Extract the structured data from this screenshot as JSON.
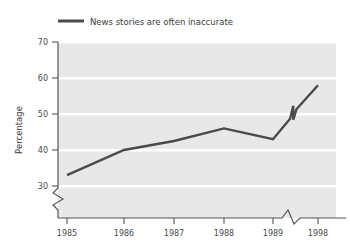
{
  "chart_data": {
    "type": "line",
    "title": "",
    "subtitle": "",
    "xlabel": "",
    "ylabel": "Percentage",
    "legend_position": "top-left",
    "grid": "horizontal-white-gridlines",
    "background_color": "#e8e8e8",
    "line_color": "#4a4a4a",
    "axis_color": "#555555",
    "x": [
      "1985",
      "1986",
      "1987",
      "1988",
      "1989",
      "1998"
    ],
    "categories": [
      "1985",
      "1986",
      "1987",
      "1988",
      "1989",
      "1998"
    ],
    "xticklabels": [
      "1985",
      "1986",
      "1987",
      "1988",
      "1989",
      "1998"
    ],
    "yticklabels": [
      "30",
      "40",
      "50",
      "60",
      "70"
    ],
    "ytickvalues": [
      30,
      40,
      50,
      60,
      70
    ],
    "ylim": [
      26,
      70
    ],
    "xaxis_break": true,
    "xaxis_break_between": [
      "1989",
      "1998"
    ],
    "yaxis_break": true,
    "yaxis_break_below": 30,
    "line_break_marker": true,
    "series": [
      {
        "name": "News stories are often inaccurate",
        "values": [
          33,
          40,
          42.5,
          46,
          43,
          58
        ]
      }
    ]
  },
  "legend": {
    "entries": [
      {
        "label": "News stories are often inaccurate",
        "color": "#4a4a4a"
      }
    ]
  },
  "axes": {
    "y_title": "Percentage",
    "y_ticks": [
      "70",
      "60",
      "50",
      "40",
      "30"
    ],
    "x_ticks": [
      "1985",
      "1986",
      "1987",
      "1988",
      "1989",
      "1998"
    ]
  }
}
